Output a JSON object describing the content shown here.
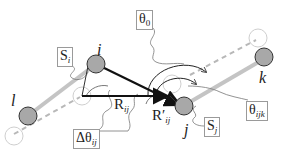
{
  "diagram": {
    "nodes": {
      "i": {
        "label": "i"
      },
      "j": {
        "label": "j"
      },
      "k": {
        "label": "k"
      },
      "l": {
        "label": "l"
      }
    },
    "labels": {
      "theta0": {
        "main": "θ",
        "sub": "0"
      },
      "s_i": {
        "main": "S",
        "sub": "i"
      },
      "s_j": {
        "main": "S",
        "sub": "j"
      },
      "delta_theta": {
        "main": "Δθ",
        "sub": "ij"
      },
      "theta_ijk": {
        "main": "θ",
        "sub": "ijk"
      },
      "r_ij": {
        "main": "R",
        "sub": "ij"
      },
      "r_prime_ij": {
        "main": "R′",
        "sub": "ij"
      }
    },
    "colors": {
      "node_fill": "#a8a8a8",
      "node_stroke": "#333333",
      "ghost_stroke": "#c8c8c8",
      "bond": "#c4c4c4",
      "arrow": "#111111",
      "box_border": "#9a9a9a"
    }
  }
}
